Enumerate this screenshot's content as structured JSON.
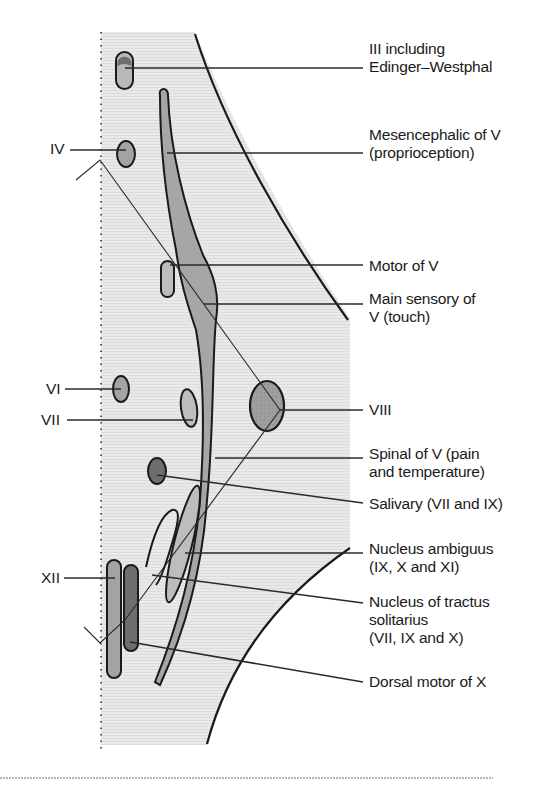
{
  "figure": {
    "colors": {
      "background_band": "#e6e6e6",
      "nucleus_light": "#b8b8b8",
      "nucleus_medium": "#a3a3a3",
      "nucleus_dark": "#707070",
      "outline": "#1a1a1a",
      "leader": "#2a2a2a",
      "rule": "#b0b0b0"
    }
  },
  "left_labels": {
    "iv": "IV",
    "vi": "VI",
    "vii": "VII",
    "xii": "XII"
  },
  "right_labels": {
    "iii": "III including\nEdinger–Westphal",
    "mesencephalic": "Mesencephalic of V\n(proprioception)",
    "motor_v": "Motor of V",
    "main_sensory": "Main sensory of\nV (touch)",
    "viii": "VIII",
    "spinal_v": "Spinal of V (pain\nand temperature)",
    "salivary": "Salivary (VII and IX)",
    "ambiguus": "Nucleus ambiguus\n(IX, X and XI)",
    "solitarius": "Nucleus of tractus\nsolitarius\n(VII, IX and X)",
    "dorsal_motor": "Dorsal motor of X"
  }
}
